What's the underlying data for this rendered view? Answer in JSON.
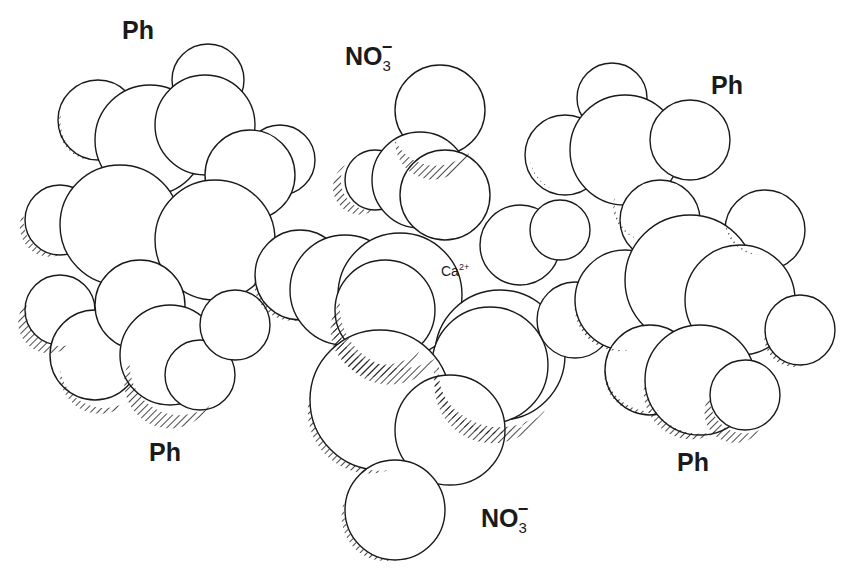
{
  "figure": {
    "type": "space-filling molecular model",
    "central_ion": {
      "symbol": "Ca",
      "charge": "2+"
    },
    "labels": [
      {
        "id": "ph-top-left",
        "text": "Ph",
        "x": 122,
        "y": 18
      },
      {
        "id": "no3-top",
        "text": "NO",
        "subscript": "3",
        "superscript": "−",
        "x": 345,
        "y": 38
      },
      {
        "id": "ph-top-right",
        "text": "Ph",
        "x": 711,
        "y": 73
      },
      {
        "id": "ph-bottom-left",
        "text": "Ph",
        "x": 149,
        "y": 440
      },
      {
        "id": "no3-bottom",
        "text": "NO",
        "subscript": "3",
        "superscript": "−",
        "x": 481,
        "y": 500
      },
      {
        "id": "ph-bottom-right",
        "text": "Ph",
        "x": 677,
        "y": 450
      }
    ],
    "ca_label": {
      "text": "Ca",
      "superscript": "2+",
      "x": 441,
      "y": 263
    },
    "style": {
      "line_color": "#1a1a1a",
      "fill": "#ffffff",
      "hatch": "diagonal"
    }
  }
}
